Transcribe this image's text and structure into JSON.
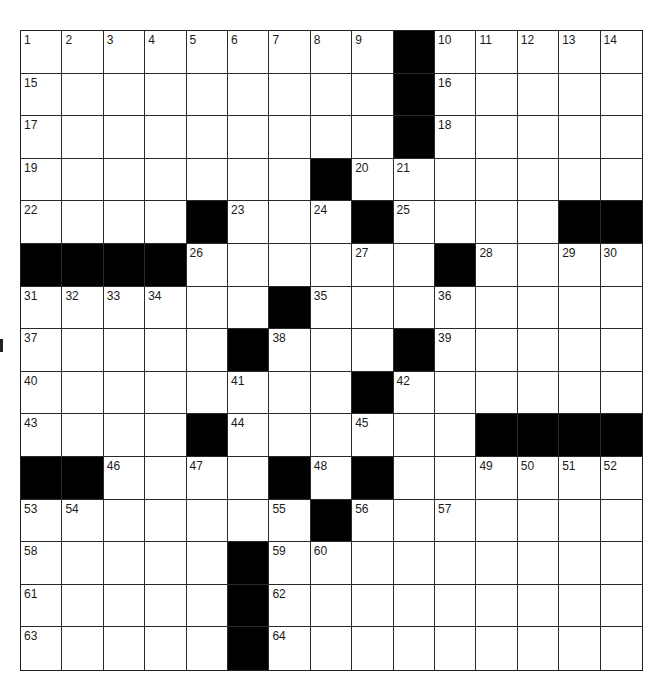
{
  "puzzle": {
    "rows": 15,
    "cols": 15,
    "grid": [
      ".........#.....",
      ".........#.....",
      ".........#.....",
      ".......#.......",
      "....#...#....##",
      "####......#....",
      "......#........",
      ".....#...#.....",
      "........#......",
      "....#......####",
      "##....#.#......",
      ".......#.......",
      ".....#.........",
      ".....#.........",
      ".....#........."
    ],
    "numbers": [
      {
        "row": 0,
        "col": 0,
        "n": "1"
      },
      {
        "row": 0,
        "col": 1,
        "n": "2"
      },
      {
        "row": 0,
        "col": 2,
        "n": "3"
      },
      {
        "row": 0,
        "col": 3,
        "n": "4"
      },
      {
        "row": 0,
        "col": 4,
        "n": "5"
      },
      {
        "row": 0,
        "col": 5,
        "n": "6"
      },
      {
        "row": 0,
        "col": 6,
        "n": "7"
      },
      {
        "row": 0,
        "col": 7,
        "n": "8"
      },
      {
        "row": 0,
        "col": 8,
        "n": "9"
      },
      {
        "row": 0,
        "col": 10,
        "n": "10"
      },
      {
        "row": 0,
        "col": 11,
        "n": "11"
      },
      {
        "row": 0,
        "col": 12,
        "n": "12"
      },
      {
        "row": 0,
        "col": 13,
        "n": "13"
      },
      {
        "row": 0,
        "col": 14,
        "n": "14"
      },
      {
        "row": 1,
        "col": 0,
        "n": "15"
      },
      {
        "row": 1,
        "col": 10,
        "n": "16"
      },
      {
        "row": 2,
        "col": 0,
        "n": "17"
      },
      {
        "row": 2,
        "col": 10,
        "n": "18"
      },
      {
        "row": 3,
        "col": 0,
        "n": "19"
      },
      {
        "row": 3,
        "col": 8,
        "n": "20"
      },
      {
        "row": 3,
        "col": 9,
        "n": "21"
      },
      {
        "row": 4,
        "col": 0,
        "n": "22"
      },
      {
        "row": 4,
        "col": 5,
        "n": "23"
      },
      {
        "row": 4,
        "col": 7,
        "n": "24"
      },
      {
        "row": 4,
        "col": 9,
        "n": "25"
      },
      {
        "row": 5,
        "col": 4,
        "n": "26"
      },
      {
        "row": 5,
        "col": 8,
        "n": "27"
      },
      {
        "row": 5,
        "col": 11,
        "n": "28"
      },
      {
        "row": 5,
        "col": 13,
        "n": "29"
      },
      {
        "row": 5,
        "col": 14,
        "n": "30"
      },
      {
        "row": 6,
        "col": 0,
        "n": "31"
      },
      {
        "row": 6,
        "col": 1,
        "n": "32"
      },
      {
        "row": 6,
        "col": 2,
        "n": "33"
      },
      {
        "row": 6,
        "col": 3,
        "n": "34"
      },
      {
        "row": 6,
        "col": 7,
        "n": "35"
      },
      {
        "row": 6,
        "col": 10,
        "n": "36"
      },
      {
        "row": 7,
        "col": 0,
        "n": "37"
      },
      {
        "row": 7,
        "col": 6,
        "n": "38"
      },
      {
        "row": 7,
        "col": 10,
        "n": "39"
      },
      {
        "row": 8,
        "col": 0,
        "n": "40"
      },
      {
        "row": 8,
        "col": 5,
        "n": "41"
      },
      {
        "row": 8,
        "col": 9,
        "n": "42"
      },
      {
        "row": 9,
        "col": 0,
        "n": "43"
      },
      {
        "row": 9,
        "col": 5,
        "n": "44"
      },
      {
        "row": 9,
        "col": 8,
        "n": "45"
      },
      {
        "row": 10,
        "col": 2,
        "n": "46"
      },
      {
        "row": 10,
        "col": 4,
        "n": "47"
      },
      {
        "row": 10,
        "col": 7,
        "n": "48"
      },
      {
        "row": 10,
        "col": 11,
        "n": "49"
      },
      {
        "row": 10,
        "col": 12,
        "n": "50"
      },
      {
        "row": 10,
        "col": 13,
        "n": "51"
      },
      {
        "row": 10,
        "col": 14,
        "n": "52"
      },
      {
        "row": 11,
        "col": 0,
        "n": "53"
      },
      {
        "row": 11,
        "col": 1,
        "n": "54"
      },
      {
        "row": 11,
        "col": 6,
        "n": "55"
      },
      {
        "row": 11,
        "col": 8,
        "n": "56"
      },
      {
        "row": 11,
        "col": 10,
        "n": "57"
      },
      {
        "row": 12,
        "col": 0,
        "n": "58"
      },
      {
        "row": 12,
        "col": 6,
        "n": "59"
      },
      {
        "row": 12,
        "col": 7,
        "n": "60"
      },
      {
        "row": 13,
        "col": 0,
        "n": "61"
      },
      {
        "row": 13,
        "col": 6,
        "n": "62"
      },
      {
        "row": 14,
        "col": 0,
        "n": "63"
      },
      {
        "row": 14,
        "col": 6,
        "n": "64"
      }
    ],
    "colors": {
      "block": "#000000",
      "empty": "#ffffff",
      "line": "#2a2a2a",
      "number": "#1a1a1a"
    }
  }
}
